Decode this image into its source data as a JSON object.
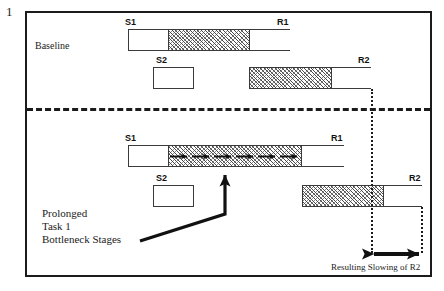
{
  "figure": {
    "number": "1",
    "panels": [
      {
        "name": "baseline",
        "label": "Baseline",
        "tasks": [
          {
            "id": "task1",
            "start_label": "S1",
            "end_label": "R1",
            "segments": [
              {
                "kind": "white",
                "x": 128,
                "width": 39
              },
              {
                "kind": "hatch",
                "x": 167,
                "width": 82
              },
              {
                "kind": "white",
                "x": 249,
                "width": 41
              }
            ],
            "y": 29,
            "height": 22
          },
          {
            "id": "task2",
            "start_label": "S2",
            "end_label": "R2",
            "segments": [
              {
                "kind": "white",
                "x": 153,
                "width": 41
              },
              {
                "kind": "hatch",
                "x": 249,
                "width": 82
              },
              {
                "kind": "white",
                "x": 331,
                "width": 40
              }
            ],
            "y": 67,
            "height": 22
          }
        ]
      },
      {
        "name": "prolonged",
        "label": "",
        "tasks": [
          {
            "id": "task1",
            "start_label": "S1",
            "end_label": "R1",
            "segments": [
              {
                "kind": "white",
                "x": 128,
                "width": 39
              },
              {
                "kind": "hatch",
                "x": 167,
                "width": 134
              },
              {
                "kind": "white",
                "x": 301,
                "width": 43
              }
            ],
            "y": 145,
            "height": 22
          },
          {
            "id": "task2",
            "start_label": "S2",
            "end_label": "R2",
            "segments": [
              {
                "kind": "white",
                "x": 153,
                "width": 41
              },
              {
                "kind": "hatch",
                "x": 302,
                "width": 81
              },
              {
                "kind": "white",
                "x": 383,
                "width": 39
              }
            ],
            "y": 185,
            "height": 22
          }
        ]
      }
    ],
    "annotations": {
      "bottleneck_note": [
        "Prolonged",
        "Task 1",
        "Bottleneck Stages"
      ],
      "slowing_caption": "Resulting Slowing of R2"
    },
    "colors": {
      "ink": "#1b1b1b",
      "hatch_dark": "#4a4a4a",
      "hatch_light": "#8d8d8d",
      "background": "#ffffff"
    }
  }
}
